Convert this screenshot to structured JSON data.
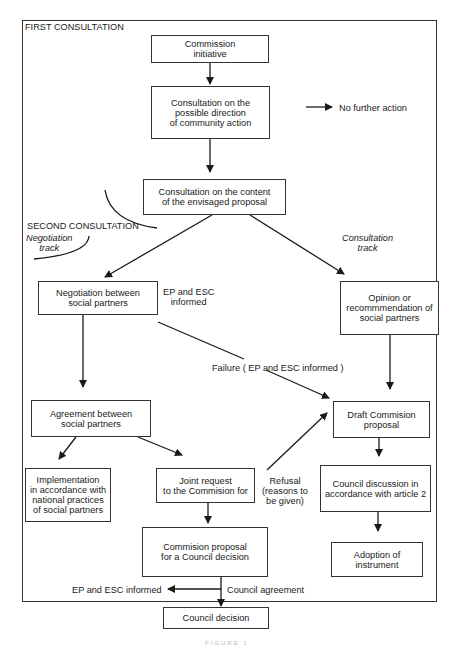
{
  "section_labels": {
    "first": "FIRST CONSULTATION",
    "second": "SECOND CONSULTATION",
    "negotiation_track": "Negotiation\ntrack",
    "consultation_track": "Consultation\ntrack"
  },
  "nodes": {
    "commission_initiative": "Commission\ninitiative",
    "consultation_direction": "Consultation on the\npossible direction\nof community action",
    "consultation_content": "Consultation on the content\nof the envisaged proposal",
    "negotiation": "Negotiation between\nsocial partners",
    "opinion": "Opinion or\nrecommmendation of\nsocial partners",
    "agreement": "Agreement between\nsocial partners",
    "draft_proposal": "Draft Commision\nproposal",
    "implementation": "Implementation\nin accordance with\nnational practices\nof social partners",
    "joint_request": "Joint request\nto the Commision for",
    "council_discussion": "Council discussion in\naccordance with article 2",
    "commission_proposal_council": "Commision proposal\nfor a Council decision",
    "adoption": "Adoption of\ninstrument",
    "council_decision": "Council decision"
  },
  "edge_labels": {
    "no_further_action": "No further action",
    "ep_esc_informed_1": "EP and ESC\ninformed",
    "failure": "Failure ( EP and ESC informed )",
    "refusal": "Refusal\n(reasons to\nbe given)",
    "ep_esc_informed_2": "EP and ESC informed",
    "council_agreement": "Council agreement"
  },
  "caption": "FIGURE 1"
}
